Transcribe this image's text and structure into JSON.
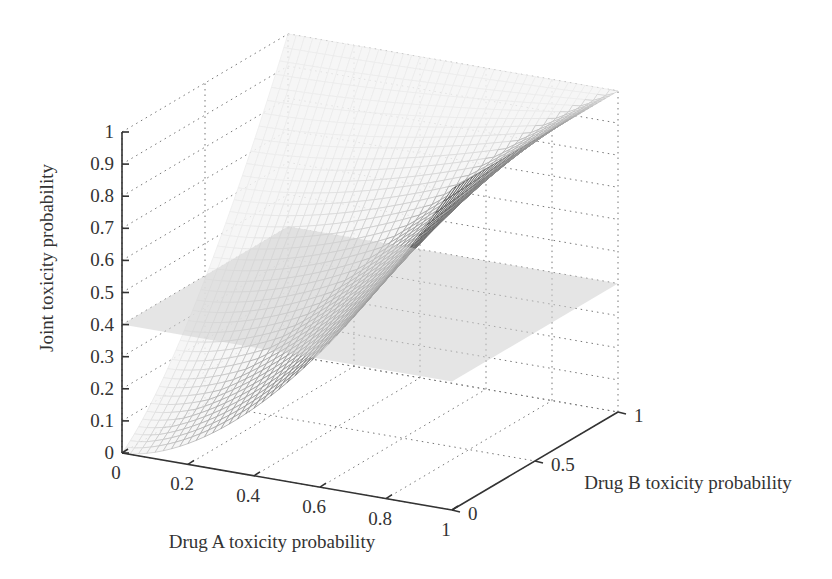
{
  "chart_data": {
    "type": "surface3d",
    "title": "",
    "xlabel": "Drug A toxicity probability",
    "ylabel": "Drug B toxicity probability",
    "zlabel": "Joint toxicity probability",
    "x_ticks": [
      "0",
      "0.2",
      "0.4",
      "0.6",
      "0.8",
      "1"
    ],
    "x_tick_values": [
      0,
      0.2,
      0.4,
      0.6,
      0.8,
      1
    ],
    "y_ticks": [
      "0",
      "0.5",
      "1"
    ],
    "y_tick_values": [
      0,
      0.5,
      1
    ],
    "z_ticks": [
      "0",
      "0.1",
      "0.2",
      "0.3",
      "0.4",
      "0.5",
      "0.6",
      "0.7",
      "0.8",
      "0.9",
      "1"
    ],
    "z_tick_values": [
      0,
      0.1,
      0.2,
      0.3,
      0.4,
      0.5,
      0.6,
      0.7,
      0.8,
      0.9,
      1
    ],
    "xlim": [
      0,
      1
    ],
    "ylim": [
      0,
      1
    ],
    "zlim": [
      0,
      1
    ],
    "grid": true,
    "legend": null,
    "series": [
      {
        "name": "Joint toxicity surface",
        "kind": "mesh",
        "description": "Joint toxicity probability as function of Drug A and Drug B toxicity probabilities; 0 at (0,0), rises to 1 along A=1 and B=1 edges",
        "corner_values": {
          "A0_B0": 0,
          "A1_B0": 1,
          "A0_B1": 1,
          "A1_B1": 1
        }
      },
      {
        "name": "Target toxicity plane",
        "kind": "plane",
        "z": 0.4
      }
    ]
  }
}
